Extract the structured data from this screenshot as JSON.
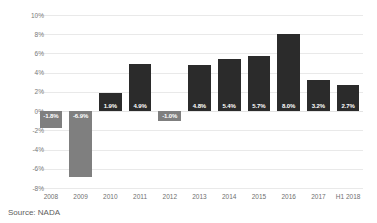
{
  "chart_data": {
    "type": "bar",
    "title": "",
    "subtitle": "",
    "xlabel": "",
    "ylabel": "",
    "ylim": [
      -8,
      10
    ],
    "yticks": [
      "10%",
      "8%",
      "6%",
      "4%",
      "2%",
      "0%",
      "-2%",
      "-4%",
      "-6%",
      "-8%"
    ],
    "ytick_values": [
      10,
      8,
      6,
      4,
      2,
      0,
      -2,
      -4,
      -6,
      -8
    ],
    "grid": true,
    "legend": "none",
    "categories": [
      "2008",
      "2009",
      "2010",
      "2011",
      "2012",
      "2013",
      "2014",
      "2015",
      "2016",
      "2017",
      "H1 2018"
    ],
    "values": [
      -1.8,
      -6.9,
      1.9,
      4.9,
      -1.0,
      4.8,
      5.4,
      5.7,
      8.0,
      3.2,
      2.7
    ],
    "data_labels": [
      "-1.8%",
      "-6.9%",
      "1.9%",
      "4.9%",
      "-1.0%",
      "4.8%",
      "5.4%",
      "5.7%",
      "8.0%",
      "3.2%",
      "2.7%"
    ],
    "colors": {
      "positive_bar": "#2b2b2b",
      "negative_bar": "#7f7f7f",
      "gridline": "#e9e9e9",
      "data_label_text": "#ffffff",
      "axis_text": "#7a7a7a",
      "background": "#ffffff"
    }
  },
  "footer": {
    "source": "Source: NADA"
  }
}
